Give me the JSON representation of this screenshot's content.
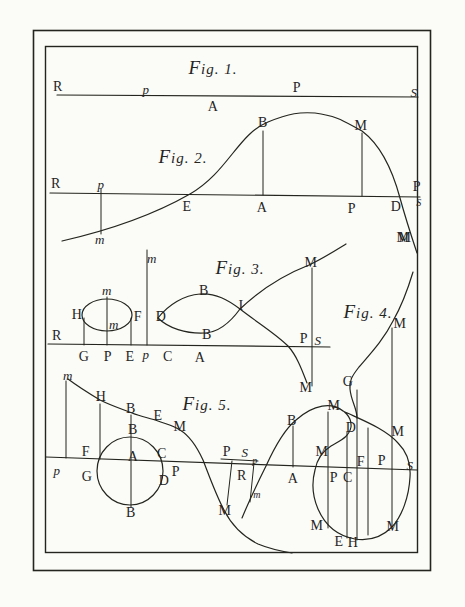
{
  "palette": {
    "paper": "#fbfbf7",
    "ink": "#25251f"
  },
  "plate": {
    "type": "engraved-plate-of-curve-diagrams"
  },
  "figures": [
    {
      "title": "Fig. 1.",
      "title_x": 213,
      "title_y": 67,
      "labels": [
        {
          "t": "R",
          "x": 58,
          "y": 87
        },
        {
          "t": "p",
          "x": 146,
          "y": 89,
          "i": 1
        },
        {
          "t": "P",
          "x": 297,
          "y": 88
        },
        {
          "t": "S",
          "x": 414,
          "y": 92,
          "i": 1
        },
        {
          "t": "A",
          "x": 213,
          "y": 107
        }
      ]
    },
    {
      "title": "Fig. 2.",
      "title_x": 183,
      "title_y": 156,
      "labels": [
        {
          "t": "R",
          "x": 56,
          "y": 184
        },
        {
          "t": "p",
          "x": 101,
          "y": 184,
          "i": 1
        },
        {
          "t": "m",
          "x": 100,
          "y": 239,
          "i": 1
        },
        {
          "t": "B",
          "x": 263,
          "y": 123
        },
        {
          "t": "M",
          "x": 361,
          "y": 126
        },
        {
          "t": "E",
          "x": 187,
          "y": 207
        },
        {
          "t": "A",
          "x": 262,
          "y": 208
        },
        {
          "t": "P",
          "x": 352,
          "y": 209
        },
        {
          "t": "D",
          "x": 396,
          "y": 207
        },
        {
          "t": "P",
          "x": 417,
          "y": 187
        },
        {
          "t": "S",
          "x": 419,
          "y": 203,
          "i": 1,
          "s": 1
        },
        {
          "t": "M",
          "x": 405,
          "y": 238
        }
      ]
    },
    {
      "title": "Fig. 3.",
      "title_x": 240,
      "title_y": 267,
      "labels": [
        {
          "t": "m",
          "x": 152,
          "y": 258,
          "i": 1
        },
        {
          "t": "R",
          "x": 57,
          "y": 336
        },
        {
          "t": "H",
          "x": 77,
          "y": 315
        },
        {
          "t": "m",
          "x": 107,
          "y": 290,
          "i": 1
        },
        {
          "t": "m",
          "x": 114,
          "y": 324,
          "i": 1
        },
        {
          "t": "F",
          "x": 138,
          "y": 317
        },
        {
          "t": "D",
          "x": 161,
          "y": 317
        },
        {
          "t": "B",
          "x": 204,
          "y": 291
        },
        {
          "t": "B",
          "x": 207,
          "y": 335
        },
        {
          "t": "I",
          "x": 241,
          "y": 306
        },
        {
          "t": "M",
          "x": 311,
          "y": 263
        },
        {
          "t": "M",
          "x": 306,
          "y": 388
        },
        {
          "t": "P",
          "x": 304,
          "y": 339
        },
        {
          "t": "S",
          "x": 318,
          "y": 340,
          "i": 1
        },
        {
          "t": "G",
          "x": 84,
          "y": 357
        },
        {
          "t": "P",
          "x": 108,
          "y": 357
        },
        {
          "t": "E",
          "x": 130,
          "y": 357
        },
        {
          "t": "p",
          "x": 146,
          "y": 354,
          "i": 1
        },
        {
          "t": "C",
          "x": 168,
          "y": 357
        },
        {
          "t": "A",
          "x": 200,
          "y": 358
        }
      ]
    },
    {
      "title": "Fig. 4.",
      "title_x": 368,
      "title_y": 311,
      "labels": [
        {
          "t": "M",
          "x": 403,
          "y": 238
        },
        {
          "t": "M",
          "x": 400,
          "y": 324
        },
        {
          "t": "G",
          "x": 348,
          "y": 382
        },
        {
          "t": "M",
          "x": 334,
          "y": 406
        },
        {
          "t": "B",
          "x": 292,
          "y": 421
        },
        {
          "t": "D",
          "x": 351,
          "y": 428
        },
        {
          "t": "M",
          "x": 398,
          "y": 432
        },
        {
          "t": "M",
          "x": 322,
          "y": 452
        },
        {
          "t": "F",
          "x": 361,
          "y": 462
        },
        {
          "t": "P",
          "x": 382,
          "y": 461
        },
        {
          "t": "S",
          "x": 410,
          "y": 465,
          "i": 1
        },
        {
          "t": "P",
          "x": 334,
          "y": 478
        },
        {
          "t": "C",
          "x": 348,
          "y": 478
        },
        {
          "t": "A",
          "x": 293,
          "y": 479
        },
        {
          "t": "M",
          "x": 317,
          "y": 526
        },
        {
          "t": "M",
          "x": 393,
          "y": 527
        },
        {
          "t": "E",
          "x": 339,
          "y": 542
        },
        {
          "t": "H",
          "x": 353,
          "y": 543
        }
      ]
    },
    {
      "title": "Fig. 5.",
      "title_x": 207,
      "title_y": 403,
      "labels": [
        {
          "t": "m",
          "x": 68,
          "y": 375,
          "i": 1
        },
        {
          "t": "H",
          "x": 101,
          "y": 397
        },
        {
          "t": "B",
          "x": 131,
          "y": 409
        },
        {
          "t": "E",
          "x": 158,
          "y": 416
        },
        {
          "t": "M",
          "x": 180,
          "y": 427
        },
        {
          "t": "F",
          "x": 86,
          "y": 452
        },
        {
          "t": "p",
          "x": 57,
          "y": 470,
          "i": 1
        },
        {
          "t": "G",
          "x": 87,
          "y": 477
        },
        {
          "t": "B",
          "x": 133,
          "y": 430
        },
        {
          "t": "A",
          "x": 133,
          "y": 457
        },
        {
          "t": "C",
          "x": 162,
          "y": 454
        },
        {
          "t": "P",
          "x": 176,
          "y": 472
        },
        {
          "t": "D",
          "x": 164,
          "y": 481
        },
        {
          "t": "B",
          "x": 131,
          "y": 513
        },
        {
          "t": "P",
          "x": 227,
          "y": 452
        },
        {
          "t": "S",
          "x": 245,
          "y": 452,
          "i": 1
        },
        {
          "t": "p",
          "x": 255,
          "y": 461,
          "i": 1,
          "s": 1
        },
        {
          "t": "R",
          "x": 242,
          "y": 476
        },
        {
          "t": "m",
          "x": 257,
          "y": 495,
          "i": 1,
          "s": 1
        },
        {
          "t": "M",
          "x": 225,
          "y": 511
        }
      ]
    }
  ]
}
